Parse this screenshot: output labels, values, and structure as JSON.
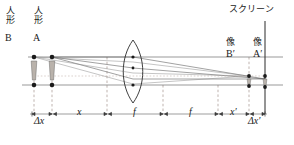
{
  "figure": {
    "type": "optics-ray-diagram",
    "width": 294,
    "height": 145,
    "background": "#ffffff",
    "ink": "#1b1b1b",
    "ray_color": "#4a4a4a",
    "dash_color": "#9a8f8a"
  },
  "labels": {
    "object_b_jp": "人形",
    "object_b_letter": "B",
    "object_a_jp": "人形",
    "object_a_letter": "A",
    "screen_jp": "スクリーン",
    "image_b_jp": "像",
    "image_b_letter": "B′",
    "image_a_jp": "像",
    "image_a_letter": "A′"
  },
  "dimensions": [
    {
      "name": "delta-x",
      "label": "Δx",
      "x_start": 32,
      "x_end": 52
    },
    {
      "name": "x",
      "label": "x",
      "x_start": 52,
      "x_end": 107
    },
    {
      "name": "f-left",
      "label": "f",
      "x_start": 107,
      "x_end": 163
    },
    {
      "name": "f-right",
      "label": "f",
      "x_start": 163,
      "x_end": 218
    },
    {
      "name": "x-prime",
      "label": "x′",
      "x_start": 218,
      "x_end": 251
    },
    {
      "name": "delta-x-prime",
      "label": "Δx′",
      "x_start": 251,
      "x_end": 265
    }
  ],
  "geometry": {
    "axis_y": 85,
    "optical_axis_y2": 57,
    "lens_center_x": 133,
    "lens_top_y": 40,
    "lens_bottom_y": 103,
    "screen_x": 265,
    "object_b_x": 34,
    "object_a_x": 52,
    "image_b_x": 249,
    "image_a_x": 265,
    "focal_left_x": 107,
    "focal_right_x": 163
  },
  "caption": {
    "text": ""
  }
}
